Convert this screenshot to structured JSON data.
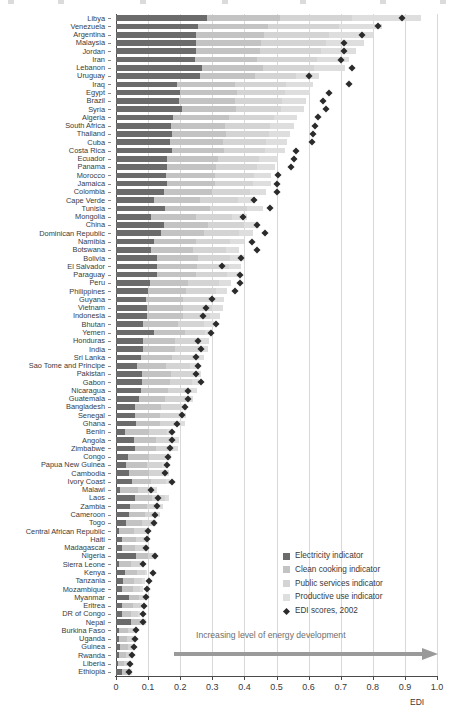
{
  "chart_data": {
    "type": "bar",
    "orientation": "horizontal",
    "stacked": true,
    "title": "",
    "xlabel": "EDI",
    "ylabel": "",
    "xlim": [
      0,
      1.0
    ],
    "xticks": [
      "0",
      "0.1",
      "0.2",
      "0.3",
      "0.4",
      "0.5",
      "0.6",
      "0.7",
      "0.8",
      "0.9",
      "1.0"
    ],
    "xtick_values": [
      0,
      0.1,
      0.2,
      0.3,
      0.4,
      0.5,
      0.6,
      0.7,
      0.8,
      0.9,
      1.0
    ],
    "grid": true,
    "legend_position": "lower-right",
    "series": [
      {
        "name": "Electricity indicator",
        "key": "electricity",
        "color": "#6b6b6b"
      },
      {
        "name": "Clean cooking indicator",
        "key": "clean_cooking",
        "color": "#c3c3c3"
      },
      {
        "name": "Public services indicator",
        "key": "public_services",
        "color": "#d4d4d4"
      },
      {
        "name": "Productive use indicator",
        "key": "productive_use",
        "color": "#dedede"
      }
    ],
    "marker_series": {
      "name": "EDI scores, 2002",
      "color": "#2b2b2b",
      "shape": "diamond"
    },
    "annotation": "Increasing level of energy development",
    "categories": [
      "Libya",
      "Venezuela",
      "Argentina",
      "Malaysia",
      "Jordan",
      "Iran",
      "Lebanon",
      "Uruguay",
      "Iraq",
      "Egypt",
      "Brazil",
      "Syria",
      "Algeria",
      "South Africa",
      "Thailand",
      "Cuba",
      "Costa Rica",
      "Ecuador",
      "Panama",
      "Morocco",
      "Jamaica",
      "Colombia",
      "Cape Verde",
      "Tunisia",
      "Mongolia",
      "China",
      "Dominican Republic",
      "Namibia",
      "Botswana",
      "Bolivia",
      "El Salvador",
      "Paraguay",
      "Peru",
      "Philippines",
      "Guyana",
      "Vietnam",
      "Indonesia",
      "Bhutan",
      "Yemen",
      "Honduras",
      "India",
      "Sri Lanka",
      "Sao Tome and Principe",
      "Pakistan",
      "Gabon",
      "Nicaragua",
      "Guatemala",
      "Bangladesh",
      "Senegal",
      "Ghana",
      "Benin",
      "Angola",
      "Zimbabwe",
      "Congo",
      "Papua New Guinea",
      "Cambodia",
      "Ivory Coast",
      "Malawi",
      "Laos",
      "Zambia",
      "Cameroon",
      "Togo",
      "Central African Republic",
      "Haiti",
      "Madagascar",
      "Nigeria",
      "Sierra Leone",
      "Kenya",
      "Tanzania",
      "Mozambique",
      "Myanmar",
      "Eritrea",
      "DR of Congo",
      "Nepal",
      "Burkina Faso",
      "Uganda",
      "Guinea",
      "Rwanda",
      "Liberia",
      "Ethiopia"
    ],
    "rows": [
      {
        "c": "Libya",
        "e": 0.285,
        "k": 0.225,
        "p": 0.225,
        "u": 0.215,
        "m": 0.89
      },
      {
        "c": "Venezuela",
        "e": 0.255,
        "k": 0.22,
        "p": 0.22,
        "u": 0.135,
        "m": 0.815
      },
      {
        "c": "Argentina",
        "e": 0.25,
        "k": 0.21,
        "p": 0.205,
        "u": 0.135,
        "m": 0.765
      },
      {
        "c": "Malaysia",
        "e": 0.248,
        "k": 0.205,
        "p": 0.2,
        "u": 0.12,
        "m": 0.71
      },
      {
        "c": "Jordan",
        "e": 0.248,
        "k": 0.2,
        "p": 0.19,
        "u": 0.11,
        "m": 0.71
      },
      {
        "c": "Iran",
        "e": 0.245,
        "k": 0.195,
        "p": 0.185,
        "u": 0.1,
        "m": 0.7
      },
      {
        "c": "Lebanon",
        "e": 0.268,
        "k": 0.19,
        "p": 0.16,
        "u": 0.095,
        "m": 0.735
      },
      {
        "c": "Uruguay",
        "e": 0.262,
        "k": 0.17,
        "p": 0.13,
        "u": 0.07,
        "m": 0.6
      },
      {
        "c": "Iraq",
        "e": 0.19,
        "k": 0.18,
        "p": 0.16,
        "u": 0.085,
        "m": 0.725
      },
      {
        "c": "Egypt",
        "e": 0.198,
        "k": 0.18,
        "p": 0.15,
        "u": 0.075,
        "m": 0.665
      },
      {
        "c": "Brazil",
        "e": 0.197,
        "k": 0.175,
        "p": 0.145,
        "u": 0.075,
        "m": 0.645
      },
      {
        "c": "Syria",
        "e": 0.205,
        "k": 0.17,
        "p": 0.14,
        "u": 0.07,
        "m": 0.655
      },
      {
        "c": "Algeria",
        "e": 0.178,
        "k": 0.175,
        "p": 0.14,
        "u": 0.07,
        "m": 0.63
      },
      {
        "c": "South Africa",
        "e": 0.17,
        "k": 0.17,
        "p": 0.14,
        "u": 0.075,
        "m": 0.62
      },
      {
        "c": "Thailand",
        "e": 0.175,
        "k": 0.168,
        "p": 0.135,
        "u": 0.065,
        "m": 0.615
      },
      {
        "c": "Cuba",
        "e": 0.168,
        "k": 0.165,
        "p": 0.135,
        "u": 0.065,
        "m": 0.61
      },
      {
        "c": "Costa Rica",
        "e": 0.175,
        "k": 0.16,
        "p": 0.13,
        "u": 0.06,
        "m": 0.56
      },
      {
        "c": "Ecuador",
        "e": 0.16,
        "k": 0.158,
        "p": 0.128,
        "u": 0.06,
        "m": 0.555
      },
      {
        "c": "Panama",
        "e": 0.158,
        "k": 0.155,
        "p": 0.125,
        "u": 0.058,
        "m": 0.545
      },
      {
        "c": "Morocco",
        "e": 0.155,
        "k": 0.152,
        "p": 0.122,
        "u": 0.055,
        "m": 0.505
      },
      {
        "c": "Jamaica",
        "e": 0.158,
        "k": 0.15,
        "p": 0.12,
        "u": 0.055,
        "m": 0.5
      },
      {
        "c": "Colombia",
        "e": 0.15,
        "k": 0.148,
        "p": 0.118,
        "u": 0.052,
        "m": 0.5
      },
      {
        "c": "Cape Verde",
        "e": 0.118,
        "k": 0.145,
        "p": 0.118,
        "u": 0.052,
        "m": 0.43
      },
      {
        "c": "Tunisia",
        "e": 0.152,
        "k": 0.142,
        "p": 0.115,
        "u": 0.05,
        "m": 0.48
      },
      {
        "c": "Mongolia",
        "e": 0.108,
        "k": 0.14,
        "p": 0.112,
        "u": 0.048,
        "m": 0.395
      },
      {
        "c": "China",
        "e": 0.15,
        "k": 0.138,
        "p": 0.11,
        "u": 0.048,
        "m": 0.44
      },
      {
        "c": "Dominican Republic",
        "e": 0.14,
        "k": 0.135,
        "p": 0.108,
        "u": 0.045,
        "m": 0.465
      },
      {
        "c": "Namibia",
        "e": 0.118,
        "k": 0.132,
        "p": 0.105,
        "u": 0.045,
        "m": 0.425
      },
      {
        "c": "Botswana",
        "e": 0.11,
        "k": 0.13,
        "p": 0.102,
        "u": 0.042,
        "m": 0.44
      },
      {
        "c": "Bolivia",
        "e": 0.128,
        "k": 0.128,
        "p": 0.1,
        "u": 0.042,
        "m": 0.39
      },
      {
        "c": "El Salvador",
        "e": 0.128,
        "k": 0.125,
        "p": 0.098,
        "u": 0.04,
        "m": 0.33
      },
      {
        "c": "Paraguay",
        "e": 0.128,
        "k": 0.122,
        "p": 0.095,
        "u": 0.038,
        "m": 0.385
      },
      {
        "c": "Peru",
        "e": 0.105,
        "k": 0.12,
        "p": 0.095,
        "u": 0.038,
        "m": 0.385
      },
      {
        "c": "Philippines",
        "e": 0.1,
        "k": 0.118,
        "p": 0.092,
        "u": 0.036,
        "m": 0.37
      },
      {
        "c": "Guyana",
        "e": 0.095,
        "k": 0.115,
        "p": 0.09,
        "u": 0.035,
        "m": 0.3
      },
      {
        "c": "Vietnam",
        "e": 0.098,
        "k": 0.112,
        "p": 0.088,
        "u": 0.034,
        "m": 0.28
      },
      {
        "c": "Indonesia",
        "e": 0.098,
        "k": 0.11,
        "p": 0.085,
        "u": 0.032,
        "m": 0.27
      },
      {
        "c": "Bhutan",
        "e": 0.085,
        "k": 0.108,
        "p": 0.082,
        "u": 0.03,
        "m": 0.31
      },
      {
        "c": "Yemen",
        "e": 0.118,
        "k": 0.098,
        "p": 0.06,
        "u": 0.022,
        "m": 0.295
      },
      {
        "c": "Honduras",
        "e": 0.085,
        "k": 0.1,
        "p": 0.078,
        "u": 0.028,
        "m": 0.255
      },
      {
        "c": "India",
        "e": 0.085,
        "k": 0.098,
        "p": 0.076,
        "u": 0.028,
        "m": 0.265
      },
      {
        "c": "Sri Lanka",
        "e": 0.078,
        "k": 0.095,
        "p": 0.075,
        "u": 0.026,
        "m": 0.25
      },
      {
        "c": "Sao Tome and Principe",
        "e": 0.065,
        "k": 0.092,
        "p": 0.072,
        "u": 0.025,
        "m": 0.255
      },
      {
        "c": "Pakistan",
        "e": 0.08,
        "k": 0.09,
        "p": 0.07,
        "u": 0.024,
        "m": 0.25
      },
      {
        "c": "Gabon",
        "e": 0.08,
        "k": 0.088,
        "p": 0.068,
        "u": 0.024,
        "m": 0.265
      },
      {
        "c": "Nicaragua",
        "e": 0.078,
        "k": 0.085,
        "p": 0.066,
        "u": 0.022,
        "m": 0.225
      },
      {
        "c": "Guatemala",
        "e": 0.072,
        "k": 0.082,
        "p": 0.064,
        "u": 0.022,
        "m": 0.225
      },
      {
        "c": "Bangladesh",
        "e": 0.06,
        "k": 0.08,
        "p": 0.062,
        "u": 0.02,
        "m": 0.215
      },
      {
        "c": "Senegal",
        "e": 0.06,
        "k": 0.078,
        "p": 0.06,
        "u": 0.02,
        "m": 0.205
      },
      {
        "c": "Ghana",
        "e": 0.062,
        "k": 0.076,
        "p": 0.058,
        "u": 0.018,
        "m": 0.19
      },
      {
        "c": "Benin",
        "e": 0.028,
        "k": 0.074,
        "p": 0.056,
        "u": 0.018,
        "m": 0.175
      },
      {
        "c": "Angola",
        "e": 0.055,
        "k": 0.07,
        "p": 0.054,
        "u": 0.017,
        "m": 0.175
      },
      {
        "c": "Zimbabwe",
        "e": 0.058,
        "k": 0.068,
        "p": 0.052,
        "u": 0.016,
        "m": 0.168
      },
      {
        "c": "Congo",
        "e": 0.038,
        "k": 0.066,
        "p": 0.05,
        "u": 0.016,
        "m": 0.162
      },
      {
        "c": "Papua New Guinea",
        "e": 0.032,
        "k": 0.064,
        "p": 0.048,
        "u": 0.015,
        "m": 0.158
      },
      {
        "c": "Cambodia",
        "e": 0.042,
        "k": 0.062,
        "p": 0.046,
        "u": 0.014,
        "m": 0.152
      },
      {
        "c": "Ivory Coast",
        "e": 0.05,
        "k": 0.06,
        "p": 0.045,
        "u": 0.014,
        "m": 0.175
      },
      {
        "c": "Malawi",
        "e": 0.012,
        "k": 0.058,
        "p": 0.044,
        "u": 0.013,
        "m": 0.11
      },
      {
        "c": "Laos",
        "e": 0.058,
        "k": 0.054,
        "p": 0.04,
        "u": 0.012,
        "m": 0.13
      },
      {
        "c": "Zambia",
        "e": 0.045,
        "k": 0.052,
        "p": 0.038,
        "u": 0.012,
        "m": 0.128
      },
      {
        "c": "Cameroon",
        "e": 0.04,
        "k": 0.05,
        "p": 0.036,
        "u": 0.011,
        "m": 0.122
      },
      {
        "c": "Togo",
        "e": 0.032,
        "k": 0.048,
        "p": 0.035,
        "u": 0.01,
        "m": 0.118
      },
      {
        "c": "Central African Republic",
        "e": 0.01,
        "k": 0.046,
        "p": 0.034,
        "u": 0.01,
        "m": 0.1
      },
      {
        "c": "Haiti",
        "e": 0.018,
        "k": 0.044,
        "p": 0.032,
        "u": 0.009,
        "m": 0.098
      },
      {
        "c": "Madagascar",
        "e": 0.018,
        "k": 0.042,
        "p": 0.03,
        "u": 0.009,
        "m": 0.095
      },
      {
        "c": "Nigeria",
        "e": 0.062,
        "k": 0.038,
        "p": 0.022,
        "u": 0.006,
        "m": 0.12
      },
      {
        "c": "Sierra Leone",
        "e": 0.008,
        "k": 0.04,
        "p": 0.028,
        "u": 0.008,
        "m": 0.085
      },
      {
        "c": "Kenya",
        "e": 0.028,
        "k": 0.036,
        "p": 0.026,
        "u": 0.008,
        "m": 0.115
      },
      {
        "c": "Tanzania",
        "e": 0.022,
        "k": 0.035,
        "p": 0.025,
        "u": 0.007,
        "m": 0.102
      },
      {
        "c": "Mozambique",
        "e": 0.018,
        "k": 0.034,
        "p": 0.024,
        "u": 0.007,
        "m": 0.098
      },
      {
        "c": "Myanmar",
        "e": 0.042,
        "k": 0.03,
        "p": 0.02,
        "u": 0.006,
        "m": 0.092
      },
      {
        "c": "Eritrea",
        "e": 0.02,
        "k": 0.032,
        "p": 0.022,
        "u": 0.006,
        "m": 0.088
      },
      {
        "c": "DR of Congo",
        "e": 0.018,
        "k": 0.03,
        "p": 0.022,
        "u": 0.006,
        "m": 0.085
      },
      {
        "c": "Nepal",
        "e": 0.048,
        "k": 0.026,
        "p": 0.016,
        "u": 0.005,
        "m": 0.085
      },
      {
        "c": "Burkina Faso",
        "e": 0.008,
        "k": 0.028,
        "p": 0.02,
        "u": 0.005,
        "m": 0.062
      },
      {
        "c": "Uganda",
        "e": 0.008,
        "k": 0.026,
        "p": 0.018,
        "u": 0.005,
        "m": 0.058
      },
      {
        "c": "Guinea",
        "e": 0.012,
        "k": 0.024,
        "p": 0.016,
        "u": 0.004,
        "m": 0.055
      },
      {
        "c": "Rwanda",
        "e": 0.008,
        "k": 0.022,
        "p": 0.015,
        "u": 0.004,
        "m": 0.05
      },
      {
        "c": "Liberia",
        "e": 0.006,
        "k": 0.02,
        "p": 0.014,
        "u": 0.004,
        "m": 0.045
      },
      {
        "c": "Ethiopia",
        "e": 0.02,
        "k": 0.016,
        "p": 0.01,
        "u": 0.003,
        "m": 0.04
      }
    ]
  },
  "axis": {
    "x_title": "EDI",
    "tick_labels": [
      "0",
      "0.1",
      "0.2",
      "0.3",
      "0.4",
      "0.5",
      "0.6",
      "0.7",
      "0.8",
      "0.9",
      "1.0"
    ]
  },
  "legend": {
    "items": [
      {
        "label": "Electricity indicator",
        "swatch": "s0"
      },
      {
        "label": "Clean cooking indicator",
        "swatch": "s1"
      },
      {
        "label": "Public services indicator",
        "swatch": "s2"
      },
      {
        "label": "Productive use indicator",
        "swatch": "s3"
      },
      {
        "label": "EDI scores, 2002",
        "swatch": "diamond"
      }
    ]
  },
  "annotation": {
    "arrow_label": "Increasing level of energy development"
  }
}
